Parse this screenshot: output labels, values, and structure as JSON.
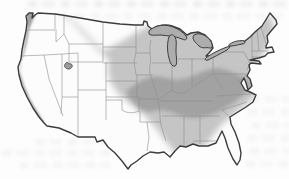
{
  "page": {
    "background": "#fdfdfd"
  },
  "map": {
    "label": "United States range map with shaded distribution regions",
    "colors": {
      "land": "#fcfcfc",
      "outline": "#3c3c3c",
      "state_border": "#8f8f8f",
      "range_light": "#c5c5c5",
      "range_dark": "#a2a2a2",
      "lakes": "#adadad",
      "salt_lake": "#9b9b9b"
    },
    "features": {
      "outline": {
        "label": "Contiguous United States outline"
      },
      "states": {
        "label": "State borders"
      },
      "range_light": {
        "label": "Light gray shaded range: central Plains band, Upper Midwest, Northeast, and Gulf-Atlantic coastal fringe"
      },
      "range_dark": {
        "label": "Dark gray shaded range: Ozarks, mid-South and Appalachians to Chesapeake Bay"
      },
      "range_pacific": {
        "label": "Dark gray strip along the Pacific coast"
      },
      "lake_superior": {
        "label": "Lake Superior"
      },
      "lake_michigan": {
        "label": "Lake Michigan"
      },
      "lake_huron": {
        "label": "Lake Huron"
      },
      "lake_erie": {
        "label": "Lake Erie"
      },
      "lake_ontario": {
        "label": "Lake Ontario"
      },
      "great_salt_lake": {
        "label": "Great Salt Lake"
      }
    },
    "artifacts": {
      "label": "Faint illegible ink bleed-through from reverse side of page"
    }
  }
}
